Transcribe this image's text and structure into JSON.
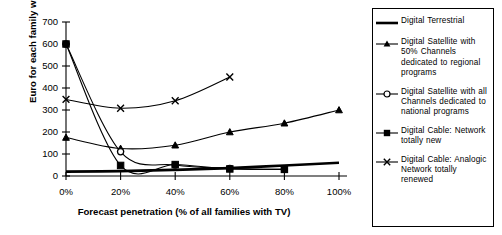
{
  "chart_data": {
    "type": "line",
    "title": "",
    "xlabel": "Forecast penetration (% of all families with TV)",
    "ylabel": "Euro for each family with TV",
    "x": [
      0,
      20,
      40,
      60,
      80,
      100
    ],
    "xtick_labels": [
      "0%",
      "20%",
      "40%",
      "60%",
      "80%",
      "100%"
    ],
    "ytick_labels": [
      "0",
      "100",
      "200",
      "300",
      "400",
      "500",
      "600",
      "700"
    ],
    "ytick_values": [
      0,
      100,
      200,
      300,
      400,
      500,
      600,
      700
    ],
    "xlim": [
      0,
      100
    ],
    "ylim": [
      0,
      700
    ],
    "grid": false,
    "legend_position": "right",
    "series": [
      {
        "name": "Digital Terrestrial",
        "marker": "none",
        "line": "thick",
        "x": [
          0,
          20,
          40,
          60,
          80,
          100
        ],
        "values": [
          20,
          22,
          28,
          36,
          48,
          60
        ]
      },
      {
        "name": "Digital Satellite with 50% Channels dedicated to regional programs",
        "marker": "triangle",
        "line": "thin",
        "x": [
          0,
          20,
          40,
          60,
          80,
          100
        ],
        "values": [
          175,
          125,
          140,
          200,
          240,
          300
        ]
      },
      {
        "name": "Digital Satellite with all Channels dedicated to national programs",
        "marker": "circle",
        "line": "thin",
        "x": [
          0,
          20,
          40,
          60,
          80
        ],
        "values": [
          600,
          110,
          50,
          35,
          30
        ]
      },
      {
        "name": "Digital Cable: Network totally new",
        "marker": "square",
        "line": "thin",
        "x": [
          0,
          20,
          40,
          60,
          80
        ],
        "values": [
          600,
          48,
          52,
          32,
          30
        ]
      },
      {
        "name": "Digital Cable: Analogic Network totally renewed",
        "marker": "x",
        "line": "thin",
        "x": [
          0,
          20,
          40,
          60
        ],
        "values": [
          348,
          308,
          342,
          450
        ]
      }
    ],
    "colors": {
      "line": "#000000",
      "background": "#ffffff",
      "axis": "#000000"
    }
  },
  "legend": {
    "items": [
      {
        "label": "Digital Terrestrial",
        "marker": "none"
      },
      {
        "label": "Digital Satellite with 50% Channels dedicated to regional programs",
        "marker": "triangle"
      },
      {
        "label": "Digital Satellite with all Channels dedicated to national programs",
        "marker": "circle"
      },
      {
        "label": "Digital Cable: Network totally new",
        "marker": "square"
      },
      {
        "label": "Digital Cable: Analogic Network totally renewed",
        "marker": "x"
      }
    ]
  }
}
